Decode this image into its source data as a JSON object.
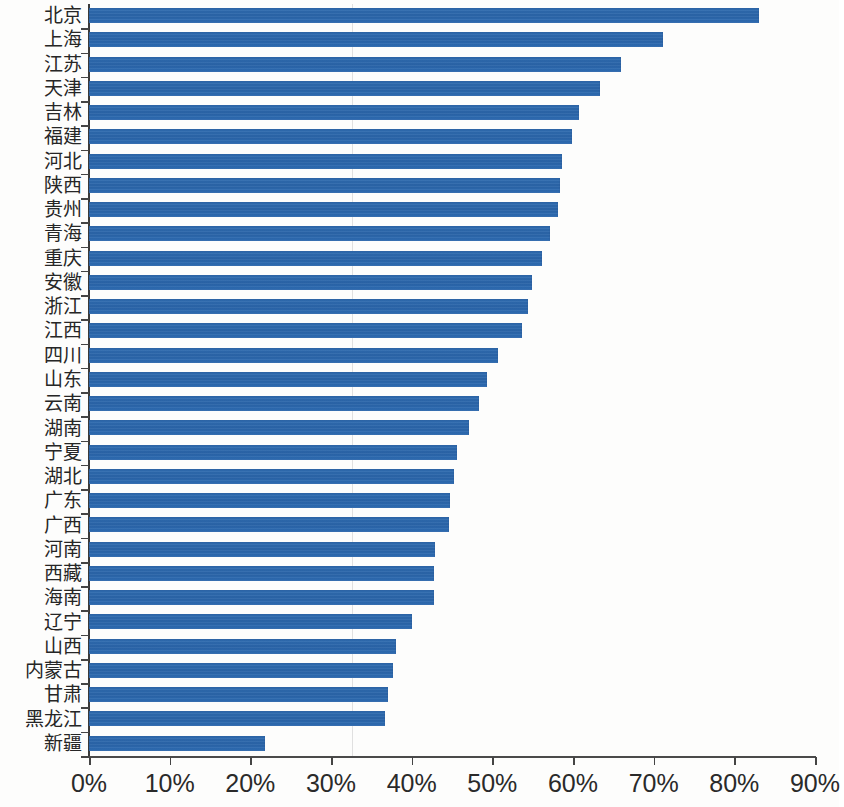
{
  "chart_data": {
    "type": "bar",
    "orientation": "horizontal",
    "title": "",
    "subtitle": "",
    "xlabel": "",
    "ylabel": "",
    "xlim": [
      0,
      90
    ],
    "xtick_labels": [
      "0%",
      "10%",
      "20%",
      "30%",
      "40%",
      "50%",
      "60%",
      "70%",
      "80%",
      "90%"
    ],
    "xticks": [
      0,
      10,
      20,
      30,
      40,
      50,
      60,
      70,
      80,
      90
    ],
    "grid": false,
    "legend": null,
    "series_color": "#2e6db4",
    "axis_color": "#444444",
    "categories": [
      "北京",
      "上海",
      "江苏",
      "天津",
      "吉林",
      "福建",
      "河北",
      "陕西",
      "贵州",
      "青海",
      "重庆",
      "安徽",
      "浙江",
      "江西",
      "四川",
      "山东",
      "云南",
      "湖南",
      "宁夏",
      "湖北",
      "广东",
      "广西",
      "河南",
      "西藏",
      "海南",
      "辽宁",
      "山西",
      "内蒙古",
      "甘肃",
      "黑龙江",
      "新疆"
    ],
    "values": [
      83.1,
      71.1,
      65.9,
      63.4,
      60.8,
      59.9,
      58.6,
      58.4,
      58.2,
      57.2,
      56.1,
      54.9,
      54.4,
      53.7,
      50.7,
      49.4,
      48.3,
      47.1,
      45.6,
      45.3,
      44.7,
      44.6,
      42.9,
      42.8,
      42.8,
      40.1,
      38.0,
      37.7,
      37.1,
      36.7,
      21.8
    ],
    "value_unit": "%"
  }
}
